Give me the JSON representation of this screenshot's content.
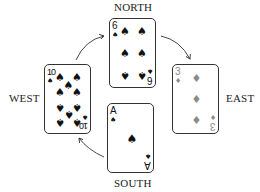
{
  "labels": {
    "north": "NORTH",
    "east": "EAST",
    "south": "SOUTH",
    "west": "WEST"
  },
  "cards": {
    "north": {
      "rank": "6",
      "suit": "spades",
      "suit_glyph": "♠",
      "color": "#111111"
    },
    "east": {
      "rank": "3",
      "suit": "diamonds",
      "suit_glyph": "♦",
      "color": "#8a8a8a"
    },
    "south": {
      "rank": "A",
      "suit": "spades",
      "suit_glyph": "♠",
      "color": "#111111"
    },
    "west": {
      "rank": "10",
      "suit": "spades",
      "suit_glyph": "♠",
      "color": "#111111"
    }
  },
  "arrows": [
    {
      "from": "west",
      "to": "north"
    },
    {
      "from": "north",
      "to": "east"
    },
    {
      "from": "south",
      "to": "west"
    }
  ]
}
